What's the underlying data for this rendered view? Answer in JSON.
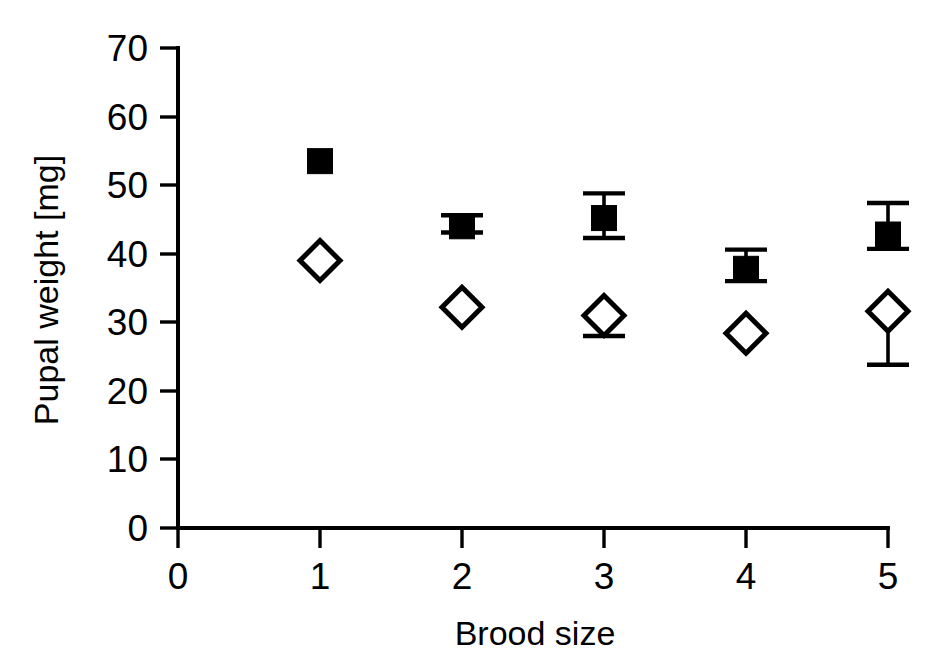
{
  "chart_data": {
    "type": "scatter",
    "title": "",
    "xlabel": "Brood size",
    "ylabel": "Pupal weight [mg]",
    "x": [
      1,
      2,
      3,
      4,
      5
    ],
    "xlim": [
      0,
      5
    ],
    "ylim": [
      0,
      70
    ],
    "xticks": [
      0,
      1,
      2,
      3,
      4,
      5
    ],
    "xticklabels": [
      "0",
      "1",
      "2",
      "3",
      "4",
      "5"
    ],
    "yticks": [
      0,
      10,
      20,
      30,
      40,
      50,
      60,
      70
    ],
    "yticklabels": [
      "0",
      "10",
      "20",
      "30",
      "40",
      "50",
      "60",
      "70"
    ],
    "grid": false,
    "legend": "none",
    "series": [
      {
        "name": "filled-square",
        "marker": "filled square",
        "color": "#000000",
        "values": [
          53.5,
          44.0,
          45.2,
          37.8,
          42.8
        ],
        "err_upper": [
          0.0,
          1.6,
          3.6,
          2.8,
          4.6
        ],
        "err_lower": [
          0.0,
          0.9,
          2.9,
          1.8,
          2.1
        ]
      },
      {
        "name": "open-diamond",
        "marker": "open diamond",
        "color": "#ffffff",
        "values": [
          39.0,
          32.2,
          31.0,
          28.4,
          31.6
        ],
        "err_upper": [
          0.0,
          0.0,
          0.0,
          0.0,
          0.0
        ],
        "err_lower": [
          0.0,
          0.0,
          3.0,
          0.0,
          7.8
        ]
      }
    ]
  },
  "axes": {
    "x_title": "Brood size",
    "y_title": "Pupal weight [mg]"
  }
}
